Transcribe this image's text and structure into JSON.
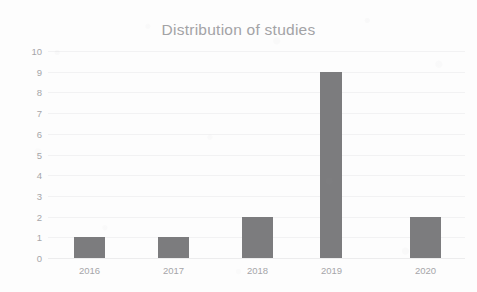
{
  "chart_data": {
    "type": "bar",
    "title": "Distribution of studies",
    "xlabel": "",
    "ylabel": "",
    "categories": [
      "2016",
      "2017",
      "2018",
      "2019",
      "2020"
    ],
    "values": [
      1,
      1,
      2,
      9,
      2
    ],
    "ylim": [
      0,
      10
    ],
    "y_ticks": [
      "10",
      "9",
      "8",
      "7",
      "6",
      "5",
      "4",
      "3",
      "2",
      "1",
      "0"
    ],
    "grid": true,
    "legend": "none",
    "bar_color": "#7c7c7e",
    "grid_color": "#f2f2f3",
    "title_color": "#a3a3a6",
    "tick_label_color": "#a6a6a9",
    "background_color": "#fdfdfd"
  }
}
